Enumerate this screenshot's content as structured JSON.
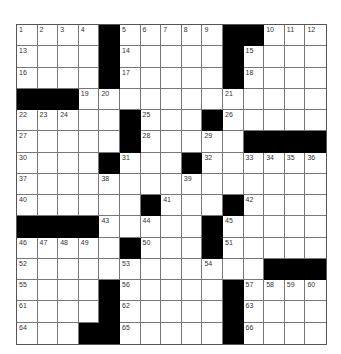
{
  "puzzle": {
    "rows": 15,
    "cols": 15,
    "colors": {
      "block": "#000000",
      "cell": "#ffffff",
      "line": "#777777",
      "number": "#333333"
    },
    "grid": [
      [
        "1",
        "2",
        "3",
        "4",
        "#",
        "5",
        "6",
        "7",
        "8",
        "9",
        "#",
        "#",
        "10",
        "11",
        "12"
      ],
      [
        "13",
        "",
        "",
        "",
        "#",
        "14",
        "",
        "",
        "",
        "",
        "#",
        "15",
        "",
        "",
        ""
      ],
      [
        "16",
        "",
        "",
        "",
        "#",
        "17",
        "",
        "",
        "",
        "",
        "#",
        "18",
        "",
        "",
        ""
      ],
      [
        "#",
        "#",
        "#",
        "19",
        "20",
        "",
        "",
        "",
        "",
        "",
        "21",
        "",
        "",
        "",
        ""
      ],
      [
        "22",
        "23",
        "24",
        "",
        "",
        "#",
        "25",
        "",
        "",
        "#",
        "26",
        "",
        "",
        "",
        ""
      ],
      [
        "27",
        "",
        "",
        "",
        "",
        "#",
        "28",
        "",
        "",
        "29",
        "",
        "#",
        "#",
        "#",
        "#"
      ],
      [
        "30",
        "",
        "",
        "",
        "#",
        "31",
        "",
        "",
        "#",
        "32",
        "",
        "33",
        "34",
        "35",
        "36"
      ],
      [
        "37",
        "",
        "",
        "",
        "38",
        "",
        "",
        "",
        "39",
        "",
        "",
        "",
        "",
        "",
        ""
      ],
      [
        "40",
        "",
        "",
        "",
        "",
        "",
        "#",
        "41",
        "",
        "",
        "#",
        "42",
        "",
        "",
        ""
      ],
      [
        "#",
        "#",
        "#",
        "#",
        "43",
        "",
        "44",
        "",
        "",
        "#",
        "45",
        "",
        "",
        "",
        ""
      ],
      [
        "46",
        "47",
        "48",
        "49",
        "",
        "#",
        "50",
        "",
        "",
        "#",
        "51",
        "",
        "",
        "",
        ""
      ],
      [
        "52",
        "",
        "",
        "",
        "",
        "53",
        "",
        "",
        "",
        "54",
        "",
        "",
        "#",
        "#",
        "#"
      ],
      [
        "55",
        "",
        "",
        "",
        "#",
        "56",
        "",
        "",
        "",
        "",
        "#",
        "57",
        "58",
        "59",
        "60"
      ],
      [
        "61",
        "",
        "",
        "",
        "#",
        "62",
        "",
        "",
        "",
        "",
        "#",
        "63",
        "",
        "",
        ""
      ],
      [
        "64",
        "",
        "",
        "#",
        "#",
        "65",
        "",
        "",
        "",
        "",
        "#",
        "66",
        "",
        "",
        ""
      ]
    ]
  }
}
